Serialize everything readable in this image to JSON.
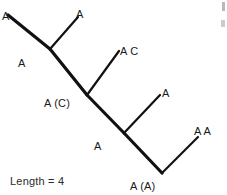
{
  "figure": {
    "background_color": "#ffffff",
    "line_color": "#111111",
    "text_color": "#1a1a1a"
  },
  "tips": [
    {
      "id": "tip-1",
      "label": "A",
      "x": 2,
      "y": 11
    },
    {
      "id": "tip-2",
      "label": "A",
      "x": 76,
      "y": 9
    },
    {
      "id": "tip-3",
      "label": "A C",
      "x": 120,
      "y": 46
    },
    {
      "id": "tip-4",
      "label": "A",
      "x": 162,
      "y": 88
    },
    {
      "id": "tip-5",
      "label": "A A",
      "x": 194,
      "y": 126
    }
  ],
  "nodes": [
    {
      "id": "node-1",
      "label": "A",
      "x": 18,
      "y": 58
    },
    {
      "id": "node-2",
      "label": "A (C)",
      "x": 44,
      "y": 98
    },
    {
      "id": "node-3",
      "label": "A",
      "x": 94,
      "y": 141
    },
    {
      "id": "node-4",
      "label": "A (A)",
      "x": 130,
      "y": 181
    }
  ],
  "branches": [
    {
      "id": "branch-tip1",
      "from": [
        8,
        15
      ],
      "to": [
        50,
        49
      ],
      "width": 3.2
    },
    {
      "id": "branch-tip2",
      "from": [
        78,
        17
      ],
      "to": [
        50,
        49
      ],
      "width": 2.2
    },
    {
      "id": "branch-trunk-1",
      "from": [
        50,
        49
      ],
      "to": [
        87,
        95
      ],
      "width": 3.2
    },
    {
      "id": "branch-tip3",
      "from": [
        119,
        51
      ],
      "to": [
        87,
        95
      ],
      "width": 2.2
    },
    {
      "id": "branch-trunk-2",
      "from": [
        87,
        95
      ],
      "to": [
        124,
        133
      ],
      "width": 3.2
    },
    {
      "id": "branch-tip4",
      "from": [
        160,
        95
      ],
      "to": [
        124,
        133
      ],
      "width": 2.2
    },
    {
      "id": "branch-trunk-3",
      "from": [
        124,
        133
      ],
      "to": [
        162,
        173
      ],
      "width": 3.2
    },
    {
      "id": "branch-tip5",
      "from": [
        198,
        137
      ],
      "to": [
        162,
        173
      ],
      "width": 2.2
    }
  ],
  "footer": {
    "length_label": "Length = 4"
  }
}
